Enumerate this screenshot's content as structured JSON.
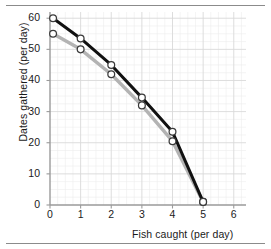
{
  "chart_data": {
    "type": "line",
    "title": "",
    "subtitle": "",
    "xlabel": "Fish caught (per day)",
    "ylabel": "Dates gathered (per day)",
    "xlim": [
      0,
      6.4
    ],
    "ylim": [
      0,
      62
    ],
    "xticks": [
      0,
      1,
      2,
      3,
      4,
      5,
      6
    ],
    "xtick_labels": [
      "0",
      "1",
      "2",
      "3",
      "4",
      "5",
      "6"
    ],
    "yticks": [
      0,
      10,
      20,
      30,
      40,
      50,
      60
    ],
    "ytick_labels": [
      "0",
      "10",
      "20",
      "30",
      "40",
      "50",
      "60"
    ],
    "grid": true,
    "grid_minor": true,
    "legend": false,
    "legend_position": "none",
    "marker": "open-circle",
    "annotations": [],
    "series": [
      {
        "name": "outer-frontier",
        "color": "#111111",
        "linewidth": 3.0,
        "x": [
          0.1,
          1,
          2,
          3,
          4,
          5
        ],
        "values": [
          60,
          53.5,
          45,
          34.5,
          23.5,
          1
        ]
      },
      {
        "name": "inner-frontier",
        "color": "#b3b3b3",
        "linewidth": 3.4,
        "x": [
          0.1,
          1,
          2,
          3,
          4,
          5
        ],
        "values": [
          55,
          50,
          42,
          32,
          20.5,
          1
        ]
      }
    ]
  },
  "colors": {
    "axis": "#9a9a9a",
    "grid_major": "#d9d9d9",
    "grid_minor": "#ededed",
    "text": "#1a1a1a",
    "rule": "#8b8b8b",
    "marker_fill": "#ffffff",
    "marker_stroke": "#3a3a3a"
  }
}
